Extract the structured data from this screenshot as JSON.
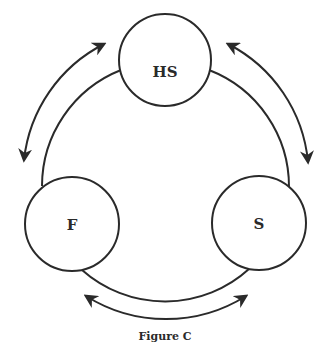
{
  "diagram": {
    "nodes": [
      {
        "id": "hs",
        "label": "HS",
        "cx": 165,
        "cy": 60,
        "r": 46
      },
      {
        "id": "f",
        "label": "F",
        "cx": 72,
        "cy": 224,
        "r": 47
      },
      {
        "id": "s",
        "label": "S",
        "cx": 259,
        "cy": 223,
        "r": 47
      }
    ],
    "edges": [
      {
        "from": "hs",
        "to": "f",
        "type": "bidirectional"
      },
      {
        "from": "hs",
        "to": "s",
        "type": "bidirectional"
      },
      {
        "from": "f",
        "to": "s",
        "type": "bidirectional"
      }
    ],
    "caption": "Figure C",
    "stroke_color": "#2a2a2a"
  }
}
